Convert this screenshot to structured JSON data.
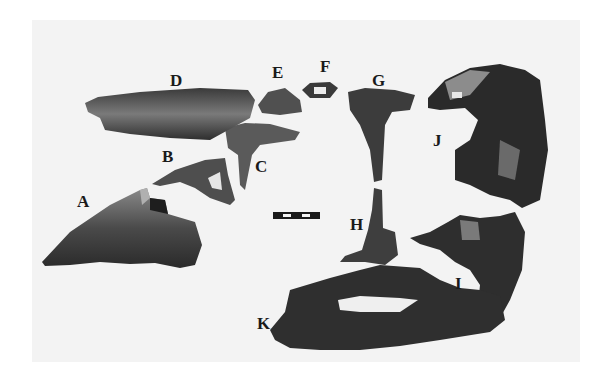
{
  "figure": {
    "background_color": "#f3f3f3",
    "bone_colors": {
      "dark": "#2a2a2a",
      "mid": "#5a5a5a",
      "light": "#9a9a9a"
    },
    "scale_bar": {
      "segments": 5,
      "pattern": [
        "black",
        "white",
        "black",
        "white",
        "black"
      ]
    },
    "specimens": [
      {
        "label": "A"
      },
      {
        "label": "B"
      },
      {
        "label": "C"
      },
      {
        "label": "D"
      },
      {
        "label": "E"
      },
      {
        "label": "F"
      },
      {
        "label": "G"
      },
      {
        "label": "H"
      },
      {
        "label": "I"
      },
      {
        "label": "J"
      },
      {
        "label": "K"
      }
    ]
  }
}
